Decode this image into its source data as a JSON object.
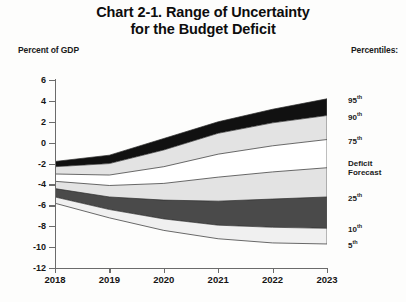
{
  "title": {
    "line1": "Chart 2-1.  Range of Uncertainty",
    "line2": "for the Budget Deficit"
  },
  "axis_unit_label": "Percent of GDP",
  "legend_heading": "Percentiles:",
  "legend": [
    {
      "label": "95",
      "suffix": "th",
      "value": 4.2
    },
    {
      "label": "90",
      "suffix": "th",
      "value": 2.6
    },
    {
      "label": "75",
      "suffix": "th",
      "value": 0.3
    },
    {
      "label": "Deficit",
      "label2": "Forecast",
      "suffix": "",
      "value": -2.4
    },
    {
      "label": "25",
      "suffix": "th",
      "value": -5.2
    },
    {
      "label": "10",
      "suffix": "th",
      "value": -8.2
    },
    {
      "label": "5",
      "suffix": "th",
      "value": -9.7
    }
  ],
  "chart_data": {
    "type": "area",
    "title": "Chart 2-1.  Range of Uncertainty for the Budget Deficit",
    "subtitle": "",
    "xlabel": "",
    "ylabel": "Percent of GDP",
    "x": [
      "2018",
      "2019",
      "2020",
      "2021",
      "2022",
      "2023"
    ],
    "xtick_labels": [
      "2018",
      "2019",
      "2020",
      "2021",
      "2022",
      "2023"
    ],
    "ytick_labels": [
      "6",
      "4",
      "2",
      "0",
      "-2",
      "-4",
      "-6",
      "-8",
      "-10",
      "-12"
    ],
    "ylim": [
      -12,
      6
    ],
    "ytick_step": 2,
    "grid": false,
    "legend_position": "right",
    "series": [
      {
        "name": "95th",
        "values": [
          -1.8,
          -1.2,
          0.4,
          2.0,
          3.2,
          4.2
        ]
      },
      {
        "name": "90th",
        "values": [
          -2.3,
          -2.0,
          -0.7,
          0.9,
          1.9,
          2.6
        ]
      },
      {
        "name": "75th",
        "values": [
          -3.0,
          -3.1,
          -2.3,
          -1.1,
          -0.3,
          0.3
        ]
      },
      {
        "name": "Deficit Forecast",
        "values": [
          -3.7,
          -4.1,
          -3.9,
          -3.3,
          -2.8,
          -2.4
        ]
      },
      {
        "name": "25th",
        "values": [
          -4.4,
          -5.2,
          -5.5,
          -5.6,
          -5.4,
          -5.2
        ]
      },
      {
        "name": "10th",
        "values": [
          -5.2,
          -6.4,
          -7.3,
          -7.9,
          -8.1,
          -8.2
        ]
      },
      {
        "name": "5th",
        "values": [
          -5.8,
          -7.2,
          -8.4,
          -9.2,
          -9.6,
          -9.7
        ]
      }
    ],
    "band_fills": [
      {
        "between": [
          "95th",
          "90th"
        ],
        "fill": "#111111",
        "name": "90th-95th"
      },
      {
        "between": [
          "90th",
          "75th"
        ],
        "fill": "#e3e3e3",
        "name": "75th-90th"
      },
      {
        "between": [
          "75th",
          "Deficit Forecast"
        ],
        "fill": "#ffffff",
        "name": "forecast-75th"
      },
      {
        "between": [
          "Deficit Forecast",
          "25th"
        ],
        "fill": "#e3e3e3",
        "name": "25th-forecast"
      },
      {
        "between": [
          "25th",
          "10th"
        ],
        "fill": "#4a4a4a",
        "name": "10th-25th"
      },
      {
        "between": [
          "10th",
          "5th"
        ],
        "fill": "#f0f0f0",
        "name": "5th-10th"
      }
    ],
    "colors": {
      "dark": "#111111",
      "mid_dark": "#4a4a4a",
      "light_gray": "#e3e3e3",
      "pale_gray": "#f0f0f0",
      "white": "#ffffff",
      "axis": "#6b6b6b"
    }
  }
}
